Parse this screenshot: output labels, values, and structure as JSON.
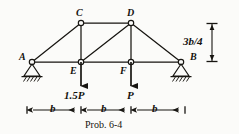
{
  "figure": {
    "caption": "Prob. 6-4",
    "ink_color": "#171511",
    "paper_color": "#fbfbf9"
  },
  "joints": [
    {
      "id": "A",
      "label": "A",
      "x": 32,
      "y": 62,
      "label_x": 19,
      "label_y": 52,
      "support": "pin"
    },
    {
      "id": "C",
      "label": "C",
      "x": 81,
      "y": 23,
      "label_x": 76,
      "label_y": 8,
      "support": "none"
    },
    {
      "id": "D",
      "label": "D",
      "x": 131,
      "y": 23,
      "label_x": 127,
      "label_y": 8,
      "support": "none"
    },
    {
      "id": "B",
      "label": "B",
      "x": 181,
      "y": 62,
      "label_x": 190,
      "label_y": 52,
      "support": "pin"
    },
    {
      "id": "E",
      "label": "E",
      "x": 81,
      "y": 62,
      "label_x": 70,
      "label_y": 66,
      "support": "none"
    },
    {
      "id": "F",
      "label": "F",
      "x": 131,
      "y": 62,
      "label_x": 120,
      "label_y": 66,
      "support": "none"
    }
  ],
  "members": [
    {
      "from": "A",
      "to": "C"
    },
    {
      "from": "C",
      "to": "D"
    },
    {
      "from": "D",
      "to": "B"
    },
    {
      "from": "A",
      "to": "E"
    },
    {
      "from": "E",
      "to": "F"
    },
    {
      "from": "F",
      "to": "B"
    },
    {
      "from": "C",
      "to": "E"
    },
    {
      "from": "D",
      "to": "F"
    },
    {
      "from": "E",
      "to": "D"
    }
  ],
  "loads": [
    {
      "id": "load-E",
      "label": "1.5P",
      "joint": "E",
      "x": 81,
      "y_start": 62,
      "y_end": 88,
      "label_x": 64,
      "label_y": 92,
      "direction": "down"
    },
    {
      "id": "load-F",
      "label": "P",
      "joint": "F",
      "x": 131,
      "y_start": 62,
      "y_end": 88,
      "label_x": 127,
      "label_y": 92,
      "direction": "down"
    }
  ],
  "dimensions": {
    "horizontal": {
      "y": 110,
      "segments": [
        {
          "label": "b",
          "x_start": 27,
          "x_end": 81,
          "label_x": 50,
          "label_y": 104
        },
        {
          "label": "b",
          "x_start": 81,
          "x_end": 131,
          "label_x": 101,
          "label_y": 104
        },
        {
          "label": "b",
          "x_start": 131,
          "x_end": 185,
          "label_x": 152,
          "label_y": 104
        }
      ]
    },
    "vertical": {
      "label": "3b/4",
      "x": 212,
      "y_start": 23,
      "y_end": 62,
      "label_x": 198,
      "label_y": 36
    }
  },
  "supports": [
    {
      "id": "support-A",
      "joint": "A",
      "type": "pin-hatched",
      "x": 32,
      "y": 62
    },
    {
      "id": "support-B",
      "joint": "B",
      "type": "pin-hatched",
      "x": 181,
      "y": 62
    }
  ]
}
